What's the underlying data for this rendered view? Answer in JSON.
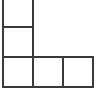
{
  "figure": {
    "kind": "polyomino-grid-figure",
    "shape_name": "L-tetromino",
    "cell_count": 4,
    "background_color": "#ffffff",
    "line_color": "#3a3a3a",
    "fill_color": "#ffffff",
    "line_width_px": 2,
    "canvas": {
      "width": 96,
      "height": 94
    },
    "grid": {
      "origin_x": 2,
      "origin_y": -4,
      "cell_width": 30,
      "cell_height": 30,
      "columns": 3,
      "rows": 3,
      "top_row_cropped": true,
      "vertical_line_x": [
        2,
        32,
        60,
        89
      ],
      "horizontal_line_y": [
        26,
        56,
        87
      ]
    },
    "cells": [
      {
        "id": "cell-r0-c0",
        "row": 0,
        "col": 0,
        "label": ""
      },
      {
        "id": "cell-r1-c0",
        "row": 1,
        "col": 0,
        "label": ""
      },
      {
        "id": "cell-r2-c0",
        "row": 2,
        "col": 0,
        "label": ""
      },
      {
        "id": "cell-r2-c1",
        "row": 2,
        "col": 1,
        "label": ""
      },
      {
        "id": "cell-r2-c2",
        "row": 2,
        "col": 2,
        "label": ""
      }
    ]
  }
}
